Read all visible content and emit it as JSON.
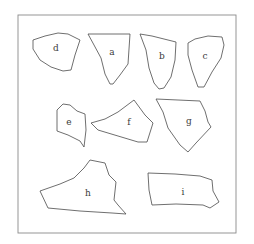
{
  "figure": {
    "width": 254,
    "height": 244,
    "frame": {
      "x": 18,
      "y": 15,
      "width": 218,
      "height": 218
    },
    "stroke_color": "#4a4a4a",
    "frame_color": "#8a8a8a"
  },
  "pieces": [
    {
      "label": "d",
      "label_pos": [
        56,
        48
      ],
      "points": "33,40 45,36 58,33 68,34 80,40 75,55 71,70 63,71 51,67 40,60 33,49"
    },
    {
      "label": "a",
      "label_pos": [
        112,
        52
      ],
      "points": "88,34 130,34 128,64 120,75 113,84 110,84 105,74 101,58 94,45"
    },
    {
      "label": "b",
      "label_pos": [
        162,
        56
      ],
      "points": "140,34 152,36 176,42 175,60 171,77 164,88 159,89 154,83 149,68 146,50"
    },
    {
      "label": "c",
      "label_pos": [
        205,
        56
      ],
      "points": "188,43 195,39 208,36 222,37 224,45 221,58 212,72 204,87 198,87 192,70 188,55"
    },
    {
      "label": "e",
      "label_pos": [
        69,
        122
      ],
      "points": "57,110 63,104 70,105 77,111 85,114 86,130 84,147 80,141 68,135 57,131"
    },
    {
      "label": "f",
      "label_pos": [
        129,
        122
      ],
      "points": "91,123 105,119 118,112 134,100 145,115 153,123 147,142 138,142 98,130"
    },
    {
      "label": "g",
      "label_pos": [
        189,
        121
      ],
      "points": "156,99 200,101 205,111 208,122 211,127 196,143 188,152 180,145 168,128 163,112"
    },
    {
      "label": "h",
      "label_pos": [
        88,
        193
      ],
      "points": "40,191 60,184 74,178 84,168 90,160 105,163 109,175 116,182 114,200 118,205 126,214 112,213 80,211 48,208"
    },
    {
      "label": "i",
      "label_pos": [
        183,
        192
      ],
      "points": "148,173 175,174 200,176 212,180 213,191 219,202 210,208 203,205 176,204 152,205 149,190"
    }
  ]
}
